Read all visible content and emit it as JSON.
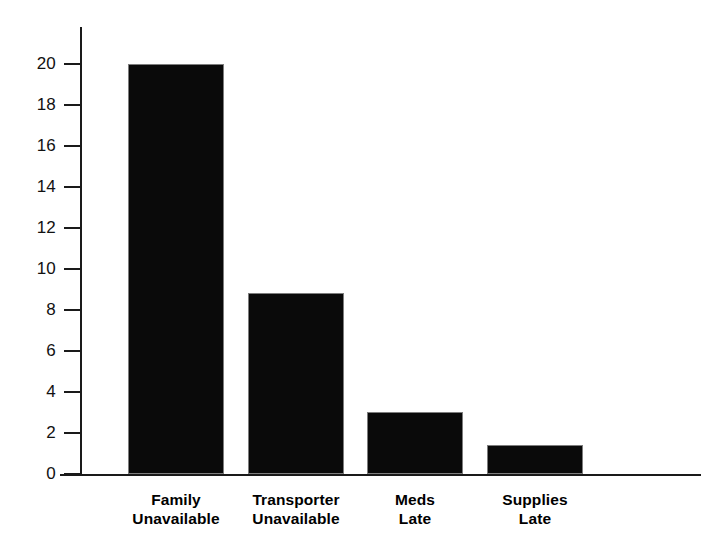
{
  "chart_data": {
    "type": "bar",
    "title": "",
    "subtitle": "",
    "xlabel": "",
    "ylabel": "",
    "categories": [
      "Family Unavailable",
      "Transporter Unavailable",
      "Meds Late",
      "Supplies Late"
    ],
    "category_lines": [
      [
        "Family",
        "Unavailable"
      ],
      [
        "Transporter",
        "Unavailable"
      ],
      [
        "Meds",
        "Late"
      ],
      [
        "Supplies",
        "Late"
      ]
    ],
    "values": [
      20,
      8.8,
      3,
      1.4
    ],
    "ylim": [
      0,
      20
    ],
    "ytick_values": [
      0,
      2,
      4,
      6,
      8,
      10,
      12,
      14,
      16,
      18,
      20
    ],
    "ytick_labels": [
      "0",
      "2",
      "4",
      "6",
      "8",
      "10",
      "12",
      "14",
      "16",
      "18",
      "20"
    ],
    "grid": false,
    "legend": false,
    "legend_position": "none",
    "bar_color": "#0a0a0a",
    "bar_edge_color": "#7d7d7d",
    "axis_color": "#1a1a1a",
    "background_color": "#ffffff"
  },
  "axes": {
    "y_tick_0": "0",
    "y_tick_2": "2",
    "y_tick_4": "4",
    "y_tick_6": "6",
    "y_tick_8": "8",
    "y_tick_10": "10",
    "y_tick_12": "12",
    "y_tick_14": "14",
    "y_tick_16": "16",
    "y_tick_18": "18",
    "y_tick_20": "20"
  },
  "labels": {
    "cat0_line0": "Family",
    "cat0_line1": "Unavailable",
    "cat1_line0": "Transporter",
    "cat1_line1": "Unavailable",
    "cat2_line0": "Meds",
    "cat2_line1": "Late",
    "cat3_line0": "Supplies",
    "cat3_line1": "Late"
  }
}
